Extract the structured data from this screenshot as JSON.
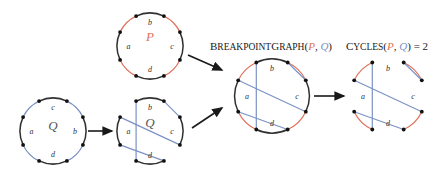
{
  "figure": {
    "colors": {
      "genome_p": "#e0705a",
      "genome_q": "#7b92c4",
      "black_block": "#303030",
      "node": "#111111",
      "arrow": "#1a1a1a",
      "background": "#ffffff"
    }
  },
  "labels": {
    "breakpoint_graph": {
      "prefix": "B",
      "word1": "REAKPOINT",
      "prefix2": "G",
      "word2": "RAPH",
      "open": "(",
      "p": "P",
      "comma": ", ",
      "q": "Q",
      "close": ")",
      "full": "BreakpointGraph(P, Q)"
    },
    "cycles": {
      "prefix": "C",
      "word": "YCLES",
      "open": "(",
      "p": "P",
      "comma": ", ",
      "q": "Q",
      "close": ")",
      "equals": " = ",
      "value": "2",
      "full": "Cycles(P, Q) = 2"
    }
  },
  "genome_p": {
    "name": "P",
    "center_label": "P",
    "blocks": [
      "b",
      "c",
      "d",
      "a"
    ],
    "block_labels": {
      "a": "a",
      "b": "b",
      "c": "c",
      "d": "d"
    },
    "node_count": 8,
    "arc_color": "#e0705a",
    "block_color": "#303030"
  },
  "genome_q": {
    "name": "Q",
    "center_label": "Q",
    "blocks": [
      "c",
      "b",
      "d",
      "a"
    ],
    "block_labels": {
      "a": "a",
      "b": "b",
      "c": "c",
      "d": "d"
    },
    "node_count": 8,
    "arc_color": "#7b92c4",
    "block_color": "#303030"
  },
  "genome_q_unfolded": {
    "name": "Q",
    "center_label": "Q",
    "block_labels": {
      "a": "a",
      "b": "b",
      "c": "c",
      "d": "d"
    },
    "chord_color": "#7b92c4",
    "block_color": "#303030"
  },
  "breakpoint_graph": {
    "block_labels": {
      "a": "a",
      "b": "b",
      "c": "c",
      "d": "d"
    },
    "red_edges_color": "#e0705a",
    "blue_edges_color": "#7b92c4",
    "black_blocks_color": "#303030",
    "node_count": 8
  },
  "cycles_graph": {
    "block_labels": {
      "a": "a",
      "b": "b",
      "c": "c",
      "d": "d"
    },
    "red_edges_color": "#e0705a",
    "blue_edges_color": "#7b92c4",
    "cycle_count": "2",
    "node_count": 8
  },
  "arrows": [
    {
      "name": "q-to-q-unfolded",
      "direction": "right"
    },
    {
      "name": "p-to-breakpoint-graph",
      "direction": "down-right"
    },
    {
      "name": "q-unfolded-to-breakpoint-graph",
      "direction": "up-right"
    },
    {
      "name": "breakpoint-graph-to-cycles",
      "direction": "right"
    }
  ]
}
